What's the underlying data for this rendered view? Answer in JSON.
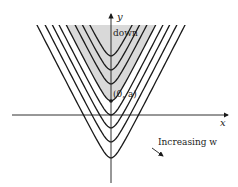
{
  "figure": {
    "axes": {
      "x_label": "x",
      "y_label": "y"
    },
    "labels": {
      "region": "down",
      "point": "(0, a)",
      "direction": "Increasing w"
    },
    "curves": {
      "type": "family of parabolas opening upward",
      "count": 8,
      "highlighted_vertex_index": 3
    },
    "colors": {
      "ink": "#1a1a1a",
      "shade": "#d9d9d9"
    }
  }
}
